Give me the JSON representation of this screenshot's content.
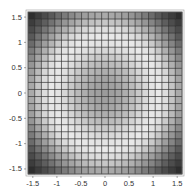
{
  "chart_data": {
    "type": "heatmap",
    "title": "",
    "xlabel": "",
    "ylabel": "",
    "xlim": [
      -1.6,
      1.6
    ],
    "ylim": [
      -1.6,
      1.6
    ],
    "x_ticks": [
      -1.5,
      -1,
      -0.5,
      0,
      0.5,
      1,
      1.5
    ],
    "x_tick_labels": [
      "-1.5",
      "-1",
      "-0.5",
      "0",
      "0.5",
      "1",
      "1.5"
    ],
    "y_ticks": [
      -1.5,
      -1,
      -0.5,
      0,
      0.5,
      1,
      1.5
    ],
    "y_tick_labels": [
      "-1.5",
      "-1",
      "-0.5",
      "0",
      "0.5",
      "1",
      "1.5"
    ],
    "grid": true,
    "mesh_cells": 23,
    "colormap": "grayscale",
    "radial_profile": {
      "r": [
        0.0,
        0.3,
        0.6,
        0.9,
        1.1,
        1.3,
        1.6,
        1.9,
        2.26
      ],
      "brightness": [
        0.6,
        0.64,
        0.75,
        0.9,
        0.95,
        0.88,
        0.6,
        0.3,
        0.05
      ]
    }
  },
  "colors": {
    "mesh_line": "#2e2e2e",
    "frame": "#555555",
    "background": "#ffffff"
  }
}
